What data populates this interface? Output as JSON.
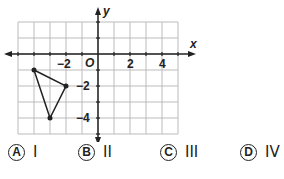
{
  "graph": {
    "x_label": "x",
    "y_label": "y",
    "origin_label": "O",
    "x_range": [
      -5,
      5
    ],
    "y_range": [
      -5,
      2
    ],
    "x_tick_labels": [
      {
        "value": -2,
        "label": "−2"
      },
      {
        "value": 2,
        "label": "2"
      },
      {
        "value": 4,
        "label": "4"
      }
    ],
    "y_tick_labels": [
      {
        "value": -2,
        "label": "−2"
      },
      {
        "value": -4,
        "label": "−4"
      }
    ],
    "triangle_vertices": [
      [
        -4,
        -1
      ],
      [
        -2,
        -2
      ],
      [
        -3,
        -4
      ]
    ],
    "line_color": "#222222",
    "grid_color": "#bbbbbb"
  },
  "options": [
    {
      "letter": "A",
      "text": "I"
    },
    {
      "letter": "B",
      "text": "II"
    },
    {
      "letter": "C",
      "text": "III"
    },
    {
      "letter": "D",
      "text": "IV"
    }
  ]
}
